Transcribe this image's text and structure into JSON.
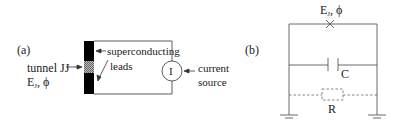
{
  "panel_a": {
    "label": "(a)",
    "tunnel_label": "tunnel JJ",
    "ej_label": "E",
    "ej_sub": "J",
    "phi_label": ", ϕ",
    "superconducting_label": "superconducting",
    "leads_label": "leads",
    "source_symbol": "I",
    "current_label_line1": "current",
    "current_label_line2": "source"
  },
  "panel_b": {
    "label": "(b)",
    "ej_label": "E",
    "ej_sub": "J",
    "phi_label": ", ϕ",
    "capacitor_label": "C",
    "resistor_label": "R"
  },
  "colors": {
    "line": "#333333",
    "lead": "#000000",
    "hatch": "#888888",
    "dashed": "#555555"
  }
}
